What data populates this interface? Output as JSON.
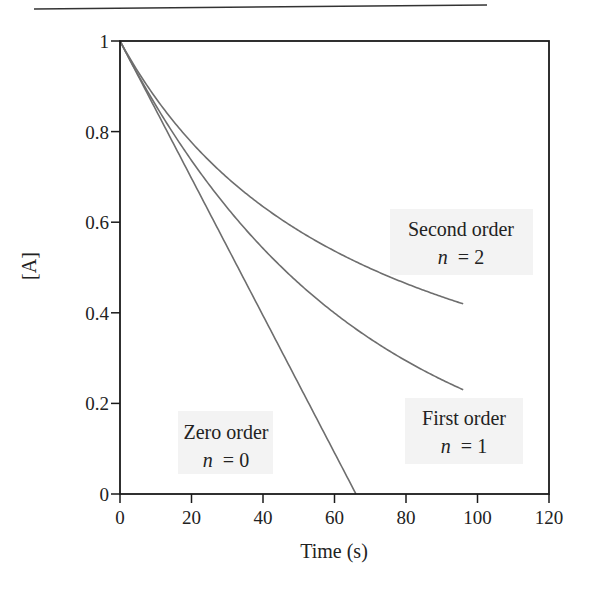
{
  "chart_data": {
    "type": "line",
    "title": "",
    "xlabel": "Time (s)",
    "ylabel": "[A]",
    "xlim": [
      0,
      120
    ],
    "ylim": [
      0,
      1
    ],
    "xticks": [
      0,
      20,
      40,
      60,
      80,
      100,
      120
    ],
    "xtick_labels": [
      "0",
      "20",
      "40",
      "60",
      "80",
      "100",
      "120"
    ],
    "yticks": [
      0,
      0.2,
      0.4,
      0.6,
      0.8,
      1
    ],
    "ytick_labels": [
      "0",
      "0.2",
      "0.4",
      "0.6",
      "0.8",
      "1"
    ],
    "grid": false,
    "legend": "none (inline annotations)",
    "series": [
      {
        "name": "Zero order",
        "order_label": "n = 0",
        "model": "[A] = 1 - k t",
        "k": 0.01515,
        "x": [
          0,
          10,
          20,
          30,
          40,
          50,
          60,
          66
        ],
        "values": [
          1.0,
          0.85,
          0.7,
          0.55,
          0.39,
          0.24,
          0.09,
          0.0
        ]
      },
      {
        "name": "First order",
        "order_label": "n = 1",
        "model": "[A] = exp(-k t)",
        "k": 0.0153,
        "x": [
          0,
          10,
          20,
          30,
          40,
          50,
          60,
          70,
          80,
          90,
          96
        ],
        "values": [
          1.0,
          0.86,
          0.74,
          0.63,
          0.54,
          0.47,
          0.4,
          0.34,
          0.29,
          0.25,
          0.23
        ]
      },
      {
        "name": "Second order",
        "order_label": "n = 2",
        "model": "[A] = 1 / (1 + k t)",
        "k": 0.0144,
        "x": [
          0,
          10,
          20,
          30,
          40,
          50,
          60,
          70,
          80,
          90,
          96
        ],
        "values": [
          1.0,
          0.87,
          0.78,
          0.7,
          0.63,
          0.58,
          0.54,
          0.5,
          0.46,
          0.44,
          0.42
        ]
      }
    ],
    "annotations": [
      {
        "text": "Zero order",
        "sub": "n = 0",
        "x": 33,
        "y": 0.1
      },
      {
        "text": "First order",
        "sub": "n = 1",
        "x": 94,
        "y": 0.14
      },
      {
        "text": "Second order",
        "sub": "n = 2",
        "x": 94,
        "y": 0.56
      }
    ],
    "line_color": "#6e6e6e",
    "axis_color": "#1a1a1a",
    "label_bg_color": "#f3f3f3"
  },
  "labels": {
    "xlabel": "Time (s)",
    "ylabel": "[A]",
    "zero_title": "Zero order",
    "zero_n": "n",
    "zero_eq": "= 0",
    "first_title": "First order",
    "first_n": "n",
    "first_eq": "= 1",
    "second_title": "Second order",
    "second_n": "n",
    "second_eq": "= 2"
  }
}
